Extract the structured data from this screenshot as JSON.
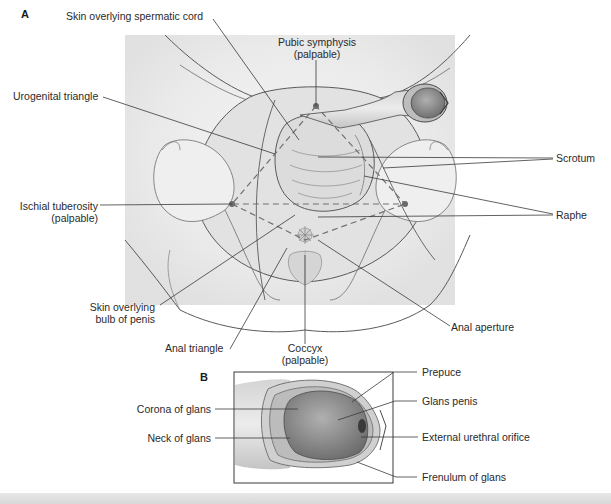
{
  "figure": {
    "panel_a": {
      "letter": "A",
      "labels": {
        "skin_spermatic_cord": "Skin overlying spermatic cord",
        "pubic_symphysis": "Pubic symphysis",
        "pubic_symphysis_note": "(palpable)",
        "urogenital_triangle": "Urogenital triangle",
        "scrotum": "Scrotum",
        "ischial_tuberosity": "Ischial tuberosity",
        "ischial_tuberosity_note": "(palpable)",
        "raphe": "Raphe",
        "skin_bulb_line1": "Skin overlying",
        "skin_bulb_line2": "bulb of penis",
        "anal_aperture": "Anal aperture",
        "anal_triangle": "Anal triangle",
        "coccyx": "Coccyx",
        "coccyx_note": "(palpable)"
      }
    },
    "panel_b": {
      "letter": "B",
      "labels": {
        "prepuce": "Prepuce",
        "glans_penis": "Glans penis",
        "corona_of_glans": "Corona of glans",
        "neck_of_glans": "Neck of glans",
        "external_urethral_orifice": "External urethral orifice",
        "frenulum_of_glans": "Frenulum of glans"
      }
    },
    "colors": {
      "background": "#ffffff",
      "body_fill": "#d9d9d9",
      "bone_fill": "#ececec",
      "outline": "#5a5a5a",
      "leader_line": "#3a3a3a",
      "dashed_triangle": "#707070",
      "glans_fill": "#8c8c8c",
      "text": "#2a2a2a"
    }
  }
}
